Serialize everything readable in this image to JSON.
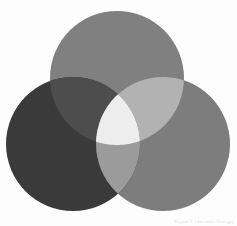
{
  "figure": {
    "background_color": "#fdfdfd",
    "width": 237,
    "height": 226
  },
  "watermark": {
    "text": "Figure 1 | ba-venn-3set.jpg",
    "color": "#e2e2e2"
  },
  "chart_data": {
    "type": "venn",
    "xlabel": "",
    "ylabel": "",
    "sets": [
      {
        "name": "Set A",
        "position": "top",
        "cx": 117,
        "cy": 78,
        "r": 67,
        "color": "#808080",
        "label": ""
      },
      {
        "name": "Set B",
        "position": "bottom-left",
        "cx": 73,
        "cy": 144,
        "r": 67,
        "color": "#3a3a3a",
        "label": ""
      },
      {
        "name": "Set C",
        "position": "bottom-right",
        "cx": 163,
        "cy": 144,
        "r": 67,
        "color": "#7d7d7d",
        "label": ""
      }
    ],
    "regions": [
      {
        "id": "A",
        "members": [
          "Set A"
        ],
        "color": "#808080"
      },
      {
        "id": "B",
        "members": [
          "Set B"
        ],
        "color": "#3a3a3a"
      },
      {
        "id": "C",
        "members": [
          "Set C"
        ],
        "color": "#7d7d7d"
      },
      {
        "id": "AB",
        "members": [
          "Set A",
          "Set B"
        ],
        "color": "#4d4d4d"
      },
      {
        "id": "AC",
        "members": [
          "Set A",
          "Set C"
        ],
        "color": "#b2b2b2"
      },
      {
        "id": "BC",
        "members": [
          "Set B",
          "Set C"
        ],
        "color": "#9b9b9b"
      },
      {
        "id": "ABC",
        "members": [
          "Set A",
          "Set B",
          "Set C"
        ],
        "color": "#ededed"
      }
    ],
    "legend_position": "none",
    "grid": false
  }
}
